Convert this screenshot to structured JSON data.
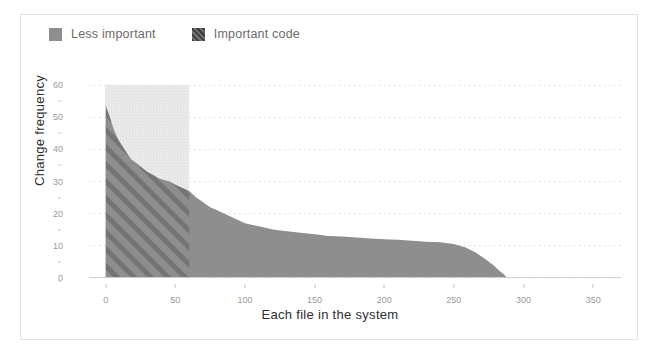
{
  "legend": {
    "items": [
      {
        "label": "Less important",
        "swatch": "legend-swatch-less-important",
        "color": "#8e8e8e"
      },
      {
        "label": "Important code",
        "swatch": "legend-swatch-important-code",
        "color": "#6d6d6d"
      }
    ]
  },
  "chart_data": {
    "type": "area",
    "title": "",
    "xlabel": "Each file in the system",
    "ylabel": "Change frequency",
    "xlim": [
      -12,
      370
    ],
    "ylim": [
      -2,
      62
    ],
    "xticks": [
      0,
      50,
      100,
      150,
      200,
      250,
      300,
      350
    ],
    "xtick_labels": [
      "0",
      "50",
      "100",
      "150",
      "200",
      "250",
      "300",
      "350"
    ],
    "yticks": [
      0,
      10,
      20,
      30,
      40,
      50,
      60
    ],
    "ytick_labels": [
      "0",
      "10",
      "20",
      "30",
      "40",
      "50",
      "60"
    ],
    "y_minor_ticks": [
      5,
      15,
      25,
      35,
      45,
      55
    ],
    "grid": "dotted-horizontal",
    "legend_position": "above-left",
    "highlight_region": {
      "name": "Important code",
      "x_start": 0,
      "x_end": 60,
      "y_start": 0,
      "y_end": 60,
      "fill": "#ededed",
      "hatch": "diagonal"
    },
    "series": [
      {
        "name": "Change frequency per file",
        "fill": "#8e8e8e",
        "x": [
          0,
          3,
          6,
          9,
          12,
          15,
          18,
          21,
          24,
          27,
          30,
          34,
          38,
          42,
          46,
          50,
          55,
          60,
          65,
          70,
          75,
          80,
          85,
          90,
          95,
          100,
          110,
          120,
          130,
          140,
          150,
          160,
          170,
          180,
          190,
          200,
          210,
          220,
          230,
          240,
          250,
          258,
          265,
          272,
          278,
          283,
          286,
          288
        ],
        "y": [
          54,
          50,
          46,
          43,
          41,
          39,
          37,
          36,
          35,
          34,
          33,
          32,
          31,
          30.5,
          30,
          29,
          28,
          27,
          25,
          23.5,
          22,
          21,
          20,
          19,
          18,
          17,
          16,
          15,
          14.5,
          14,
          13.5,
          13,
          12.8,
          12.5,
          12.2,
          12,
          11.8,
          11.5,
          11.2,
          11,
          10.5,
          9.5,
          8,
          6,
          4,
          2,
          1,
          0
        ]
      }
    ]
  }
}
